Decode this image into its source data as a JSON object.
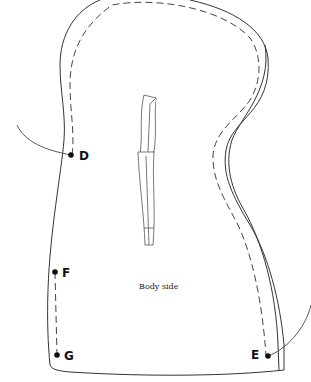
{
  "diagram": {
    "piece_label": "Body side",
    "points": [
      {
        "id": "D",
        "label": "D",
        "x": 71,
        "y": 155
      },
      {
        "id": "F",
        "label": "F",
        "x": 55,
        "y": 272
      },
      {
        "id": "G",
        "label": "G",
        "x": 57,
        "y": 355
      },
      {
        "id": "E",
        "label": "E",
        "x": 268,
        "y": 356
      }
    ],
    "colors": {
      "line": "#333333",
      "background": "#ffffff"
    }
  }
}
